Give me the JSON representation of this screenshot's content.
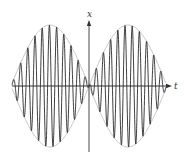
{
  "diagram": {
    "type": "beat-waveform",
    "axes": {
      "vertical_label": "x",
      "horizontal_label": "t"
    },
    "geometry": {
      "origin_x": 89,
      "origin_y": 86,
      "t_min": 12,
      "t_max": 166,
      "x_axis_left": 12,
      "x_axis_right": 172,
      "y_axis_top": 20,
      "y_axis_bottom": 152,
      "amplitude_px": 61,
      "envelope_half_period_px": 78,
      "carrier_period_px": 7.2
    },
    "colors": {
      "axis": "#333333",
      "carrier": "#2a2a2a",
      "envelope": "#b5b5b5"
    }
  }
}
